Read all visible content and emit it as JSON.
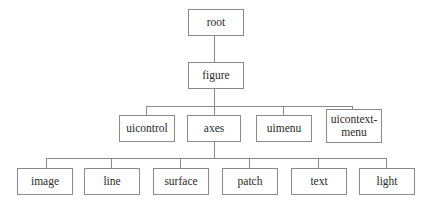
{
  "diagram": {
    "type": "tree",
    "line_color": "#8a8a8a",
    "nodes": {
      "root": "root",
      "figure": "figure",
      "uicontrol": "uicontrol",
      "axes": "axes",
      "uimenu": "uimenu",
      "uicontextmenu": "uicontext-\nmenu",
      "image": "image",
      "line": "line",
      "surface": "surface",
      "patch": "patch",
      "text": "text",
      "light": "light"
    },
    "edges": [
      [
        "root",
        "figure"
      ],
      [
        "figure",
        "uicontrol"
      ],
      [
        "figure",
        "axes"
      ],
      [
        "figure",
        "uimenu"
      ],
      [
        "figure",
        "uicontext-menu"
      ],
      [
        "axes",
        "image"
      ],
      [
        "axes",
        "line"
      ],
      [
        "axes",
        "surface"
      ],
      [
        "axes",
        "patch"
      ],
      [
        "axes",
        "text"
      ],
      [
        "axes",
        "light"
      ]
    ]
  }
}
